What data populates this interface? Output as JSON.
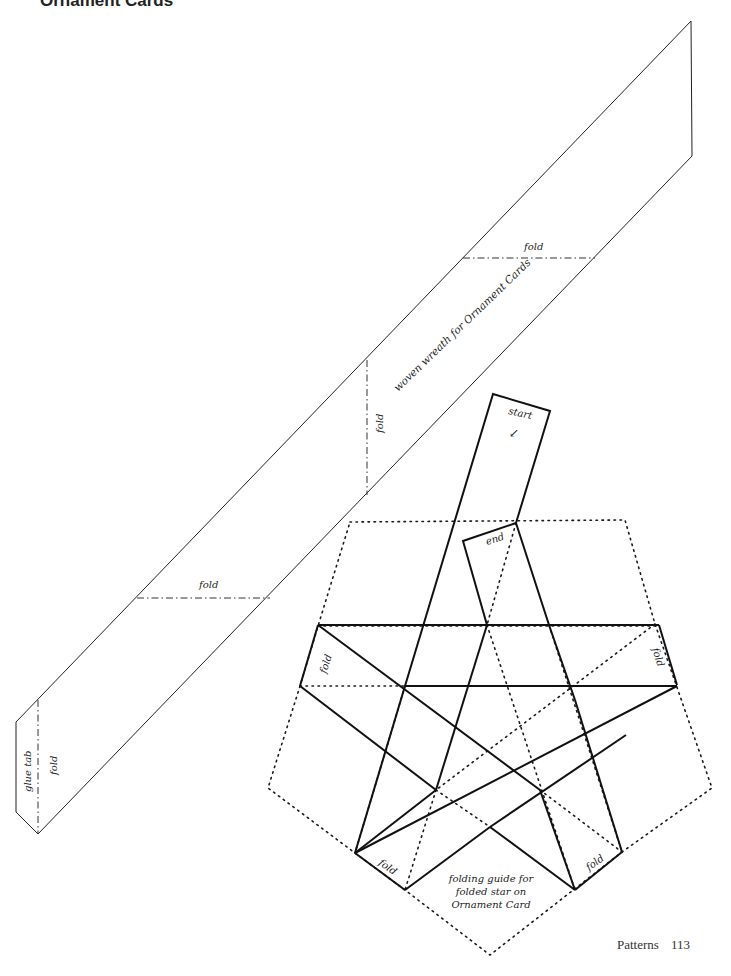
{
  "page": {
    "title": "Ornament Cards",
    "footer": {
      "section": "Patterns",
      "page_number": "113"
    }
  },
  "wreath_pattern": {
    "title": "woven wreath for Ornament Cards",
    "labels": {
      "fold_top": "fold",
      "fold_middle": "fold",
      "fold_lower": "fold",
      "fold_tab": "fold",
      "glue_tab": "glue tab"
    }
  },
  "star_pattern": {
    "caption_line1": "folding guide for",
    "caption_line2": "folded star on",
    "caption_line3": "Ornament Card",
    "labels": {
      "start": "start",
      "start_arrow": "↙",
      "end": "end",
      "fold_left": "fold",
      "fold_right": "fold",
      "fold_bottom_left": "fold",
      "fold_bottom_right": "fold"
    }
  },
  "colors": {
    "line": "#1a1a1a",
    "text": "#222222"
  }
}
